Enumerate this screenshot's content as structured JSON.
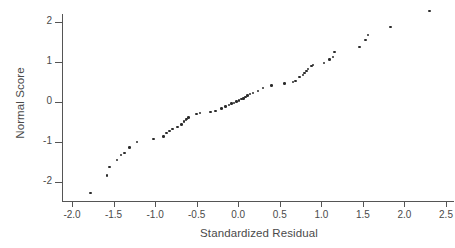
{
  "chart_data": {
    "type": "scatter",
    "title": "",
    "xlabel": "Standardized Residual",
    "ylabel": "Normal Score",
    "xlim": [
      -2.0,
      2.5
    ],
    "ylim": [
      -2.5,
      2.4
    ],
    "grid": false,
    "legend": null,
    "xticks": [
      -2.0,
      -1.5,
      -1.0,
      -0.5,
      0.0,
      0.5,
      1.0,
      1.5,
      2.0,
      2.5
    ],
    "xticklabels": [
      "-2.0",
      "-1.5",
      "-1.0",
      "-0.5",
      "0.0",
      "0.5",
      "1.0",
      "1.5",
      "2.0",
      "2.5"
    ],
    "yticks": [
      -2,
      -1,
      0,
      1,
      2
    ],
    "yticklabels": [
      "-2",
      "-1",
      "0",
      "1",
      "2"
    ],
    "marker": "square-dot",
    "marker_color": "#2b2b2b",
    "axis_color": "#555555",
    "text_color": "#4a4a4a",
    "background": "#ffffff",
    "n_points": 60,
    "series": [
      {
        "name": "residual-quantiles",
        "points": [
          [
            -1.78,
            -2.27
          ],
          [
            -1.58,
            -1.84
          ],
          [
            -1.55,
            -1.62
          ],
          [
            -1.46,
            -1.45
          ],
          [
            -1.41,
            -1.33
          ],
          [
            -1.37,
            -1.27
          ],
          [
            -1.31,
            -1.14
          ],
          [
            -1.22,
            -1.0
          ],
          [
            -1.02,
            -0.93
          ],
          [
            -0.9,
            -0.86
          ],
          [
            -0.86,
            -0.77
          ],
          [
            -0.83,
            -0.72
          ],
          [
            -0.79,
            -0.67
          ],
          [
            -0.73,
            -0.62
          ],
          [
            -0.68,
            -0.56
          ],
          [
            -0.65,
            -0.49
          ],
          [
            -0.63,
            -0.45
          ],
          [
            -0.62,
            -0.42
          ],
          [
            -0.6,
            -0.39
          ],
          [
            -0.5,
            -0.3
          ],
          [
            -0.46,
            -0.28
          ],
          [
            -0.33,
            -0.25
          ],
          [
            -0.27,
            -0.22
          ],
          [
            -0.2,
            -0.16
          ],
          [
            -0.15,
            -0.11
          ],
          [
            -0.11,
            -0.08
          ],
          [
            -0.08,
            -0.04
          ],
          [
            -0.05,
            -0.02
          ],
          [
            -0.02,
            0.01
          ],
          [
            0.01,
            0.04
          ],
          [
            0.04,
            0.07
          ],
          [
            0.06,
            0.09
          ],
          [
            0.09,
            0.13
          ],
          [
            0.11,
            0.16
          ],
          [
            0.14,
            0.2
          ],
          [
            0.18,
            0.23
          ],
          [
            0.24,
            0.28
          ],
          [
            0.3,
            0.35
          ],
          [
            0.4,
            0.41
          ],
          [
            0.56,
            0.46
          ],
          [
            0.66,
            0.5
          ],
          [
            0.69,
            0.53
          ],
          [
            0.74,
            0.62
          ],
          [
            0.78,
            0.68
          ],
          [
            0.8,
            0.72
          ],
          [
            0.82,
            0.78
          ],
          [
            0.84,
            0.82
          ],
          [
            0.88,
            0.9
          ],
          [
            0.9,
            0.92
          ],
          [
            1.03,
            0.97
          ],
          [
            1.1,
            1.06
          ],
          [
            1.14,
            1.12
          ],
          [
            1.16,
            1.25
          ],
          [
            1.46,
            1.37
          ],
          [
            1.53,
            1.55
          ],
          [
            1.56,
            1.67
          ],
          [
            1.83,
            1.88
          ],
          [
            2.3,
            2.28
          ]
        ]
      }
    ]
  },
  "axes": {
    "x_label": "Standardized Residual",
    "y_label": "Normal Score"
  }
}
